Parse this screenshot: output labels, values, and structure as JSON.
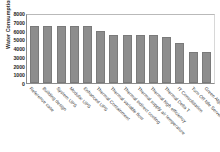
{
  "chart_data": {
    "type": "bar",
    "title": "",
    "subtitle": "",
    "xlabel": "",
    "ylabel": "Water Consumption (m³)",
    "ylim": [
      0,
      8000
    ],
    "yticks": [
      8000,
      7000,
      6000,
      5000,
      4000,
      3000,
      2000,
      1000,
      0
    ],
    "grid": false,
    "legend": "none",
    "bar_color": "#8d8d8d",
    "categories": [
      "Reference case",
      "Building design",
      "System UPS",
      "Modular UPS",
      "Enhanced UPS",
      "Thermal Containment",
      "Thermal variable flow",
      "Thermal indirect cooling",
      "Thermal supply air temperature",
      "Thermal high efficiency",
      "Thermal Delta T",
      "IT Consolidation",
      "Turn Off Idle Server",
      "Green Algorithm"
    ],
    "values": [
      6500,
      6500,
      6500,
      6500,
      6500,
      5900,
      5500,
      5500,
      5500,
      5500,
      5300,
      4600,
      3600,
      3600
    ]
  }
}
